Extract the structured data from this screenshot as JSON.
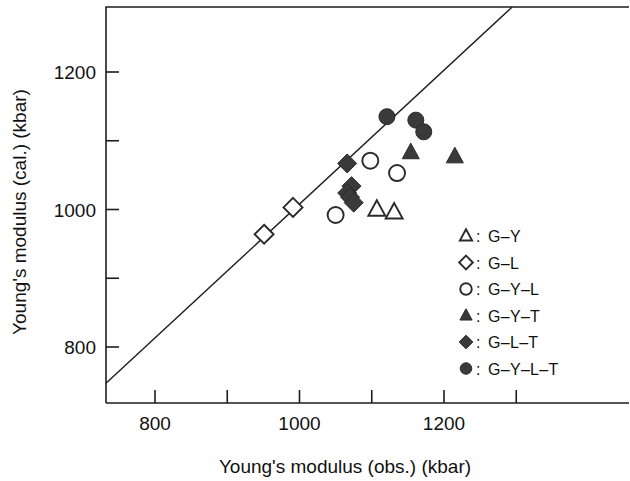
{
  "chart_data": {
    "type": "scatter",
    "title": "",
    "xlabel": "Young's modulus (obs.) (kbar)",
    "ylabel": "Young's modulus (cal.) (kbar)",
    "xlim": [
      730,
      1360
    ],
    "ylim": [
      745,
      1300
    ],
    "xticks_major": [
      800,
      1000,
      1200
    ],
    "xticks_minor": [
      900,
      1100,
      1300
    ],
    "yticks_major": [
      800,
      1000,
      1200
    ],
    "yticks_minor": [
      900,
      1100
    ],
    "xtick_labels": [
      "800",
      "1000",
      "1200"
    ],
    "ytick_labels": [
      "800",
      "1000",
      "1200"
    ],
    "grid": false,
    "legend_position": "bottom-right",
    "reference_line": {
      "name": "parity-line",
      "label": "y = x",
      "from": [
        730,
        745
      ],
      "to": [
        1300,
        1300
      ]
    },
    "series": [
      {
        "name": "G-Y",
        "label": "G–Y",
        "marker": "open-triangle",
        "color": "#ffffff",
        "edge_color": "#2b2b2b",
        "points": [
          {
            "x": 1107,
            "y": 1000
          },
          {
            "x": 1131,
            "y": 996
          }
        ]
      },
      {
        "name": "G-L",
        "label": "G–L",
        "marker": "open-diamond",
        "color": "#ffffff",
        "edge_color": "#2b2b2b",
        "points": [
          {
            "x": 991,
            "y": 1003
          },
          {
            "x": 951,
            "y": 964
          }
        ]
      },
      {
        "name": "G-Y-L",
        "label": "G–Y–L",
        "marker": "open-circle",
        "color": "#ffffff",
        "edge_color": "#2b2b2b",
        "points": [
          {
            "x": 1098,
            "y": 1071
          },
          {
            "x": 1135,
            "y": 1053
          },
          {
            "x": 1050,
            "y": 992
          }
        ]
      },
      {
        "name": "G-Y-T",
        "label": "G–Y–T",
        "marker": "filled-triangle",
        "color": "#3a3a3a",
        "edge_color": "#2a2a2a",
        "points": [
          {
            "x": 1154,
            "y": 1083
          },
          {
            "x": 1215,
            "y": 1077
          }
        ]
      },
      {
        "name": "G-L-T",
        "label": "G–L–T",
        "marker": "filled-diamond",
        "color": "#3a3a3a",
        "edge_color": "#2a2a2a",
        "points": [
          {
            "x": 1066,
            "y": 1067
          },
          {
            "x": 1072,
            "y": 1034
          },
          {
            "x": 1066,
            "y": 1024
          },
          {
            "x": 1070,
            "y": 1018
          },
          {
            "x": 1075,
            "y": 1010
          }
        ]
      },
      {
        "name": "G-Y-L-T",
        "label": "G–Y–L–T",
        "marker": "filled-circle",
        "color": "#3a3a3a",
        "edge_color": "#2a2a2a",
        "points": [
          {
            "x": 1121,
            "y": 1135
          },
          {
            "x": 1161,
            "y": 1130
          },
          {
            "x": 1172,
            "y": 1113
          }
        ]
      }
    ]
  },
  "legend": {
    "separator": ":",
    "entries": [
      {
        "marker": "open-triangle",
        "label": "G–Y"
      },
      {
        "marker": "open-diamond",
        "label": "G–L"
      },
      {
        "marker": "open-circle",
        "label": "G–Y–L"
      },
      {
        "marker": "filled-triangle",
        "label": "G–Y–T"
      },
      {
        "marker": "filled-diamond",
        "label": "G–L–T"
      },
      {
        "marker": "filled-circle",
        "label": "G–Y–L–T"
      }
    ]
  },
  "colors": {
    "marker_fill": "#3a3a3a",
    "marker_edge": "#2b2b2b",
    "axis": "#1d1d1d",
    "text": "#111111",
    "background": "#ffffff"
  }
}
